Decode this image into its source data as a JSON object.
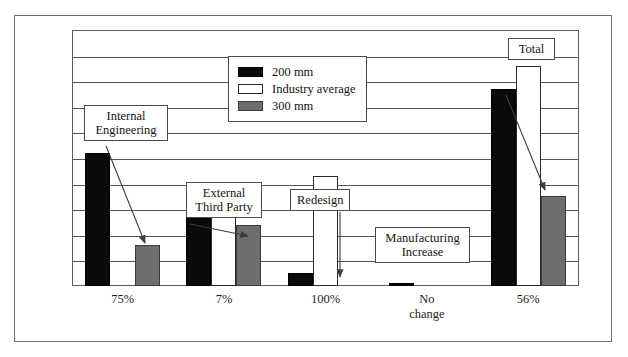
{
  "chart_data": {
    "type": "bar",
    "title": "",
    "subtitle": "",
    "xlabel": "",
    "ylabel": "",
    "grid": true,
    "gridline_count": 9,
    "ylim": [
      0,
      100
    ],
    "legend_position": "top-center",
    "categories": [
      "75%",
      "7%",
      "100%",
      "No\nchange",
      "56%"
    ],
    "series": [
      {
        "name": "200 mm",
        "color": "#0a0a0a",
        "values": [
          52,
          27,
          5,
          1,
          77
        ]
      },
      {
        "name": "Industry average",
        "color": "#ffffff",
        "values": [
          0,
          31,
          43,
          0,
          86
        ]
      },
      {
        "name": "300 mm",
        "color": "#6e6e6e",
        "values": [
          16,
          24,
          0,
          0,
          35
        ]
      }
    ],
    "annotations": [
      {
        "text": "Internal\nEngineering",
        "target": "75%-300mm-bar"
      },
      {
        "text": "External\nThird Party",
        "target": "7%-group"
      },
      {
        "text": "Redesign",
        "target": "100%-gap"
      },
      {
        "text": "Manufacturing\nIncrease",
        "target": "no-change-bar"
      },
      {
        "text": "Total",
        "target": "56%-300mm-bar"
      }
    ]
  },
  "legend": {
    "items": [
      {
        "label": "200 mm",
        "swatch": "black-swatch-icon"
      },
      {
        "label": "Industry average",
        "swatch": "white-swatch-icon"
      },
      {
        "label": "300 mm",
        "swatch": "gray-swatch-icon"
      }
    ]
  },
  "axis": {
    "tick_labels": [
      "75%",
      "7%",
      "100%",
      "No\nchange",
      "56%"
    ]
  },
  "callouts": {
    "internal_engineering": "Internal\nEngineering",
    "external_third_party": "External\nThird Party",
    "redesign": "Redesign",
    "manufacturing_increase": "Manufacturing\nIncrease",
    "total": "Total"
  },
  "colors": {
    "series_200mm": "#0a0a0a",
    "series_industry_average": "#ffffff",
    "series_300mm": "#6e6e6e",
    "frame": "#6f6f6f",
    "gridline": "#555555",
    "text": "#141414"
  }
}
